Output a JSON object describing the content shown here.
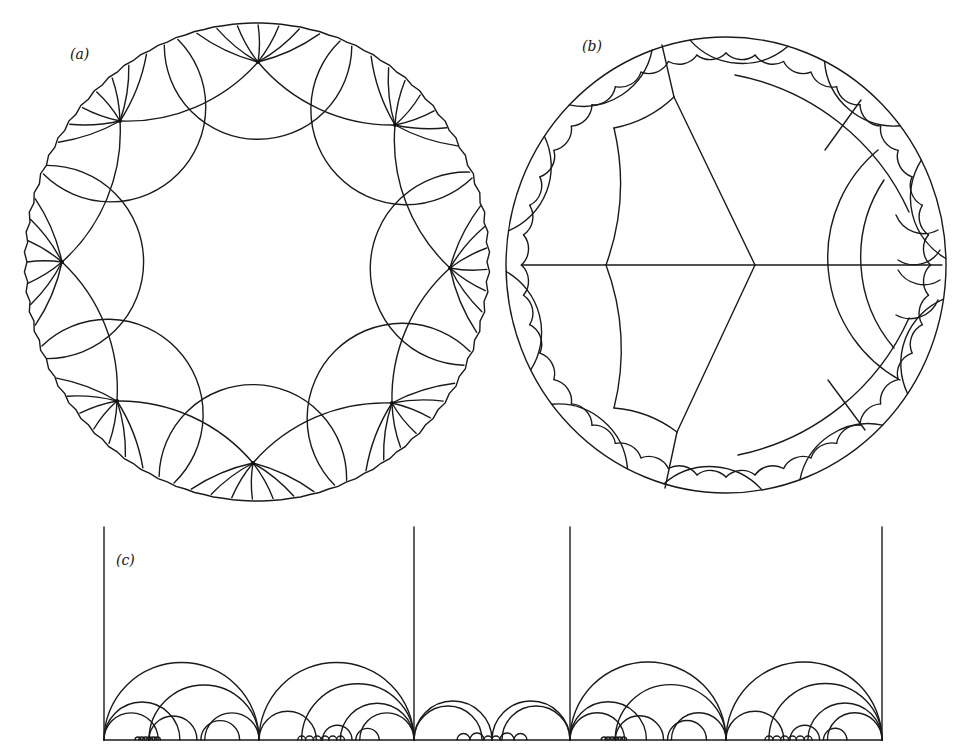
{
  "figure": {
    "panels": [
      {
        "id": "a",
        "label": "(a)",
        "label_pos": [
          70,
          46
        ],
        "description": "Poincare disk tessellation with 8 vertices of high valence near boundary"
      },
      {
        "id": "b",
        "label": "(b)",
        "label_pos": [
          582,
          38
        ],
        "description": "Poincare disk trivalent tessellation centered at a vertex"
      },
      {
        "id": "c",
        "label": "(c)",
        "label_pos": [
          116,
          552
        ],
        "description": "Upper half-plane model with vertical geodesics and nested semicircles"
      }
    ]
  },
  "geometry": {
    "a": {
      "boundary": {
        "cx": 257,
        "cy": 262,
        "rx": 230,
        "ry": 237
      },
      "vertices": [
        [
          258,
          62
        ],
        [
          395,
          125
        ],
        [
          450,
          268
        ],
        [
          392,
          403
        ],
        [
          253,
          463
        ],
        [
          117,
          401
        ],
        [
          62,
          262
        ],
        [
          120,
          121
        ]
      ]
    },
    "b": {
      "boundary": {
        "cx": 726,
        "cy": 265,
        "rx": 220,
        "ry": 228
      },
      "center": [
        755,
        265
      ],
      "inner_nodes": [
        [
          606,
          265
        ],
        [
          674,
          97
        ],
        [
          677,
          432
        ]
      ],
      "ring_nodes": [
        [
          909,
          265
        ],
        [
          830,
          152
        ],
        [
          829,
          380
        ],
        [
          616,
          128
        ],
        [
          614,
          408
        ],
        [
          886,
          212
        ],
        [
          888,
          318
        ]
      ]
    },
    "c": {
      "baseline_y": 740,
      "x_left": 104,
      "x_right": 882,
      "verticals": [
        104,
        414,
        570,
        882
      ],
      "top_y": 527
    }
  }
}
